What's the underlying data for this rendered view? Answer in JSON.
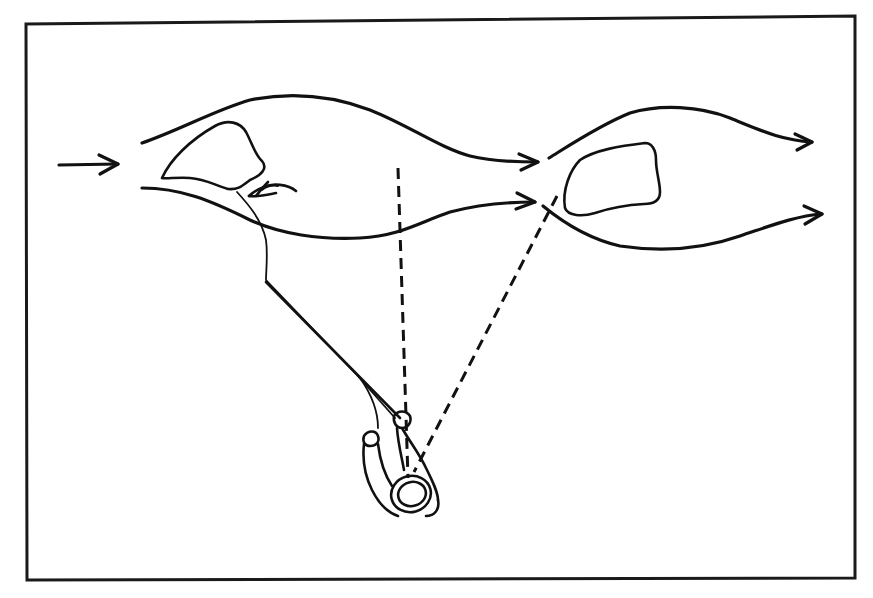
{
  "diagram": {
    "description": "Hand-drawn top-down sketch of stream current flowing around two rocks, with an angler casting a line to the eddy behind the upstream rock; dashed sight lines run from the angler toward the water.",
    "colors": {
      "ink": "#111111",
      "frame": "#1a1a1a",
      "background": "#ffffff"
    },
    "elements": {
      "current_direction_arrow": {
        "icon": "arrow-right-icon",
        "meaning": "incoming current"
      },
      "rock_upstream": {
        "icon": "rock-outline"
      },
      "rock_downstream": {
        "icon": "rock-outline"
      },
      "eddy_swirl": {
        "icon": "eddy-swirl-icon",
        "meaning": "recirculating back-current behind rock"
      },
      "flow_lines": [
        {
          "id": "upper-left-current",
          "arrowhead": true
        },
        {
          "id": "lower-left-current",
          "arrowhead": true
        },
        {
          "id": "upper-right-current",
          "arrowhead": true
        },
        {
          "id": "lower-right-current",
          "arrowhead": true
        }
      ],
      "fishing_line": {
        "from": "rod-tip",
        "to": "eddy behind upstream rock"
      },
      "sight_lines": [
        {
          "id": "vertical-sight-line",
          "style": "dashed"
        },
        {
          "id": "diagonal-sight-line",
          "style": "dashed"
        }
      ],
      "angler": {
        "icon": "angler-topdown-icon",
        "parts": [
          "hat",
          "left-arm",
          "right-arm",
          "rod"
        ]
      }
    }
  }
}
